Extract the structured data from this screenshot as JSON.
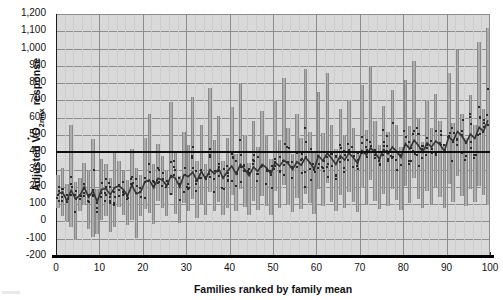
{
  "chart_data": {
    "type": "bar",
    "title": "",
    "subtitle": "",
    "xlabel": "Families ranked by family mean",
    "ylabel_text": "Adjusted VO2max response",
    "ylabel_parts": {
      "prefix": "Adjusted ",
      "v": "V",
      "o": "O",
      "sub": "2max",
      "suffix": " response"
    },
    "xlim": [
      0,
      100
    ],
    "ylim": [
      -200,
      1200
    ],
    "ytick_labels": [
      "1,200",
      "1,100",
      "1,000",
      "900",
      "800",
      "700",
      "600",
      "500",
      "400",
      "300",
      "200",
      "100",
      "0",
      "-100",
      "-200"
    ],
    "ytick_values": [
      1200,
      1100,
      1000,
      900,
      800,
      700,
      600,
      500,
      400,
      300,
      200,
      100,
      0,
      -100,
      -200
    ],
    "xtick_labels": [
      "0",
      "10",
      "20",
      "30",
      "40",
      "50",
      "60",
      "70",
      "80",
      "90",
      "100"
    ],
    "xtick_values": [
      0,
      10,
      20,
      30,
      40,
      50,
      60,
      70,
      80,
      90,
      100
    ],
    "grid": true,
    "grid_orientation": "both",
    "legend": "none",
    "reference_line": {
      "value": 400,
      "style": "thick-solid-black",
      "label": ""
    },
    "series_description": "Each vertical bar spans the range of individual adjusted VO2max responses within one family; small dark squares are individual subjects; the rising dark line connects the family means.",
    "categories": [
      1,
      2,
      3,
      4,
      5,
      6,
      7,
      8,
      9,
      10,
      11,
      12,
      13,
      14,
      15,
      16,
      17,
      18,
      19,
      20,
      21,
      22,
      23,
      24,
      25,
      26,
      27,
      28,
      29,
      30,
      31,
      32,
      33,
      34,
      35,
      36,
      37,
      38,
      39,
      40,
      41,
      42,
      43,
      44,
      45,
      46,
      47,
      48,
      49,
      50,
      51,
      52,
      53,
      54,
      55,
      56,
      57,
      58,
      59,
      60,
      61,
      62,
      63,
      64,
      65,
      66,
      67,
      68,
      69,
      70,
      71,
      72,
      73,
      74,
      75,
      76,
      77,
      78,
      79,
      80,
      81,
      82,
      83,
      84,
      85,
      86,
      87,
      88,
      89,
      90,
      91,
      92,
      93,
      94,
      95,
      96,
      97,
      98,
      99,
      100
    ],
    "series": [
      {
        "name": "Family range (min)",
        "values": [
          80,
          30,
          5,
          -30,
          -110,
          60,
          95,
          -45,
          -90,
          -75,
          10,
          30,
          -60,
          -35,
          85,
          40,
          -20,
          10,
          -95,
          30,
          70,
          50,
          -15,
          120,
          80,
          30,
          150,
          45,
          -10,
          105,
          60,
          130,
          20,
          95,
          40,
          170,
          60,
          115,
          35,
          80,
          150,
          60,
          190,
          85,
          35,
          120,
          65,
          145,
          90,
          40,
          175,
          80,
          210,
          95,
          55,
          135,
          70,
          160,
          105,
          45,
          185,
          90,
          225,
          110,
          60,
          150,
          80,
          170,
          115,
          55,
          195,
          95,
          240,
          120,
          70,
          160,
          90,
          185,
          125,
          65,
          205,
          105,
          250,
          130,
          80,
          175,
          100,
          195,
          140,
          75,
          215,
          115,
          265,
          145,
          90,
          190,
          110,
          205,
          150,
          95
        ]
      },
      {
        "name": "Family range (max)",
        "values": [
          270,
          310,
          215,
          560,
          230,
          250,
          340,
          300,
          475,
          190,
          360,
          330,
          250,
          400,
          350,
          290,
          240,
          420,
          310,
          270,
          480,
          620,
          330,
          450,
          380,
          300,
          690,
          410,
          260,
          520,
          440,
          720,
          350,
          560,
          330,
          770,
          470,
          610,
          350,
          480,
          660,
          390,
          800,
          500,
          340,
          580,
          430,
          640,
          500,
          360,
          700,
          470,
          830,
          540,
          390,
          620,
          480,
          880,
          520,
          400,
          750,
          510,
          860,
          560,
          420,
          650,
          500,
          700,
          540,
          400,
          790,
          530,
          900,
          580,
          440,
          670,
          520,
          760,
          560,
          430,
          820,
          550,
          930,
          600,
          460,
          700,
          540,
          740,
          580,
          450,
          860,
          570,
          990,
          620,
          480,
          730,
          560,
          1040,
          650,
          1120
        ]
      },
      {
        "name": "Family mean",
        "values": [
          160,
          170,
          120,
          180,
          130,
          150,
          200,
          140,
          175,
          115,
          185,
          190,
          155,
          195,
          205,
          185,
          150,
          210,
          160,
          170,
          230,
          240,
          195,
          250,
          240,
          205,
          265,
          250,
          200,
          270,
          260,
          285,
          235,
          290,
          245,
          300,
          275,
          305,
          250,
          290,
          320,
          275,
          330,
          300,
          265,
          315,
          290,
          330,
          310,
          275,
          340,
          320,
          355,
          335,
          300,
          345,
          325,
          370,
          340,
          305,
          380,
          350,
          395,
          365,
          330,
          380,
          355,
          395,
          370,
          335,
          410,
          385,
          425,
          400,
          360,
          415,
          390,
          430,
          405,
          370,
          450,
          420,
          470,
          440,
          400,
          455,
          430,
          465,
          445,
          405,
          490,
          465,
          520,
          495,
          455,
          505,
          480,
          545,
          520,
          585
        ]
      }
    ]
  }
}
